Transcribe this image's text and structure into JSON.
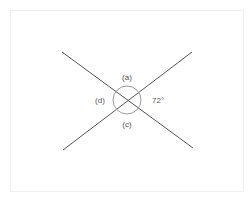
{
  "diagram": {
    "type": "intersecting-lines-angles",
    "labels": {
      "a": "(a)",
      "b": "72°",
      "c": "(c)",
      "d": "(d)"
    },
    "known_angle_degrees": 72,
    "colors": {
      "line": "#555555",
      "arc": "#999999",
      "text": "#555555",
      "frame": "#f0f0f0"
    }
  }
}
